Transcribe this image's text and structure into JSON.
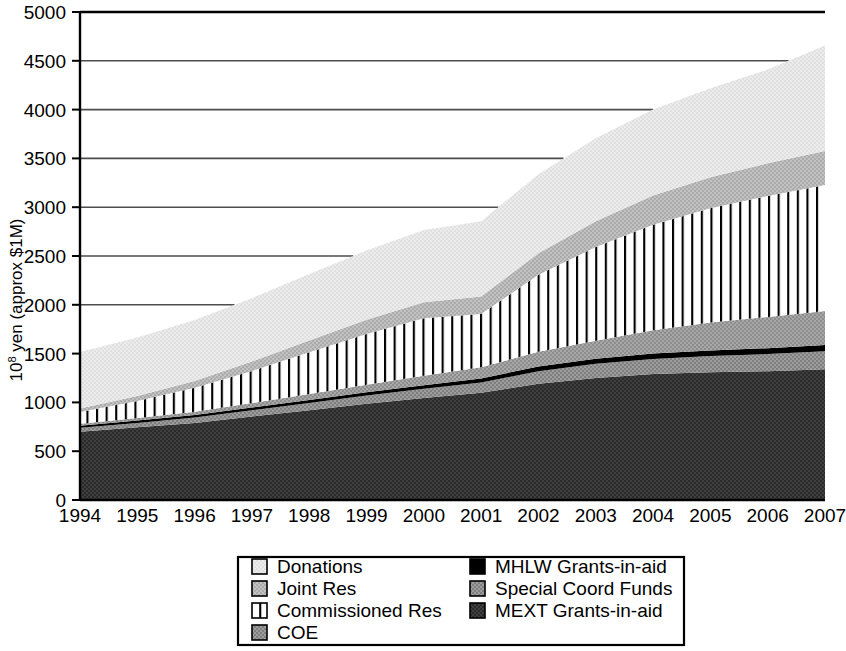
{
  "chart_data": {
    "type": "area",
    "title": "",
    "subtitle": "",
    "xlabel": "",
    "ylabel": "10^8 yen (approx $1M)",
    "ylabel_base": "10",
    "ylabel_exp": "8",
    "ylabel_rest": " yen (approx $1M)",
    "stacked": true,
    "grid": true,
    "legend_position": "bottom",
    "x": [
      1994,
      1995,
      1996,
      1997,
      1998,
      1999,
      2000,
      2001,
      2002,
      2003,
      2004,
      2005,
      2006,
      2007
    ],
    "categories": [
      "1994",
      "1995",
      "1996",
      "1997",
      "1998",
      "1999",
      "2000",
      "2001",
      "2002",
      "2003",
      "2004",
      "2005",
      "2006",
      "2007"
    ],
    "xlim": [
      1994,
      2007
    ],
    "ylim": [
      0,
      5000
    ],
    "yticks": [
      0,
      500,
      1000,
      1500,
      2000,
      2500,
      3000,
      3500,
      4000,
      4500,
      5000
    ],
    "ytick_labels": [
      "0",
      "500",
      "1000",
      "1500",
      "2000",
      "2500",
      "3000",
      "3500",
      "4000",
      "4500",
      "5000"
    ],
    "stack_order_bottom_to_top": [
      "MEXT Grants-in-aid",
      "Special Coord Funds",
      "MHLW Grants-in-aid",
      "COE",
      "Commissioned Res",
      "Joint Res",
      "Donations"
    ],
    "series": [
      {
        "name": "MEXT Grants-in-aid",
        "fill": "#3a3a3a",
        "pattern": "solid-dark",
        "values": [
          700,
          745,
          790,
          855,
          920,
          985,
          1045,
          1100,
          1190,
          1250,
          1290,
          1310,
          1320,
          1340
        ]
      },
      {
        "name": "Special Coord Funds",
        "fill": "#8c8c8c",
        "pattern": "solid-mid",
        "values": [
          40,
          45,
          55,
          65,
          75,
          85,
          95,
          105,
          130,
          145,
          155,
          165,
          175,
          185
        ]
      },
      {
        "name": "MHLW Grants-in-aid",
        "fill": "#000000",
        "pattern": "solid-black",
        "values": [
          22,
          24,
          26,
          28,
          30,
          33,
          36,
          40,
          48,
          52,
          55,
          58,
          60,
          62
        ]
      },
      {
        "name": "COE",
        "fill": "#9a9a9a",
        "pattern": "solid-mid",
        "values": [
          20,
          26,
          34,
          45,
          60,
          78,
          96,
          115,
          150,
          185,
          240,
          285,
          320,
          350
        ]
      },
      {
        "name": "Commissioned Res",
        "fill": "#ffffff",
        "pattern": "vertical-stripes",
        "values": [
          120,
          175,
          245,
          330,
          430,
          520,
          590,
          545,
          790,
          960,
          1080,
          1170,
          1240,
          1290
        ]
      },
      {
        "name": "Joint Res",
        "fill": "#b8b8b8",
        "pattern": "solid-light-mid",
        "values": [
          35,
          50,
          70,
          95,
          120,
          145,
          165,
          180,
          220,
          265,
          300,
          320,
          335,
          350
        ]
      },
      {
        "name": "Donations",
        "fill": "#e8e8e8",
        "pattern": "solid-very-light",
        "values": [
          580,
          600,
          625,
          650,
          680,
          710,
          740,
          770,
          810,
          850,
          880,
          910,
          960,
          1080
        ]
      }
    ],
    "totals": [
      1517,
      1665,
      1845,
      2068,
      2315,
      2556,
      2767,
      2855,
      3338,
      3707,
      4000,
      4218,
      4410,
      4657
    ]
  },
  "legend": {
    "columns": [
      {
        "entries": [
          {
            "label": "Donations",
            "swatch": "very-light"
          },
          {
            "label": "Joint Res",
            "swatch": "light-mid"
          },
          {
            "label": "Commissioned Res",
            "swatch": "stripes"
          },
          {
            "label": "COE",
            "swatch": "mid"
          }
        ]
      },
      {
        "entries": [
          {
            "label": "MHLW Grants-in-aid",
            "swatch": "black"
          },
          {
            "label": "Special Coord Funds",
            "swatch": "mid"
          },
          {
            "label": "MEXT Grants-in-aid",
            "swatch": "dark"
          }
        ]
      }
    ]
  },
  "colors": {
    "donations": "#e8e8e8",
    "joint_res": "#b8b8b8",
    "commissioned_res": "#ffffff",
    "coe": "#9a9a9a",
    "mhlw": "#000000",
    "special_coord": "#8c8c8c",
    "mext": "#3a3a3a",
    "gridline": "#4d4d4d",
    "axis": "#000000"
  }
}
